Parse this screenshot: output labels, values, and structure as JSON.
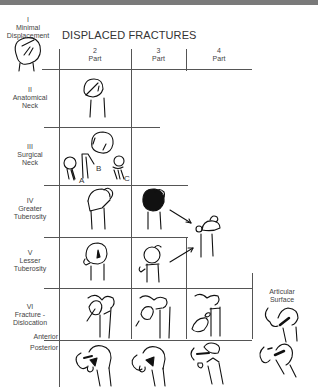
{
  "title": "DISPLACED FRACTURES",
  "columns": [
    {
      "num": "2",
      "label": "Part"
    },
    {
      "num": "3",
      "label": "Part"
    },
    {
      "num": "4",
      "label": "Part"
    }
  ],
  "rows": [
    {
      "roman": "I",
      "line1": "Minimal",
      "line2": "Displacement"
    },
    {
      "roman": "II",
      "line1": "Anatomical",
      "line2": "Neck"
    },
    {
      "roman": "III",
      "line1": "Surgical",
      "line2": "Neck"
    },
    {
      "roman": "IV",
      "line1": "Greater",
      "line2": "Tuberosity"
    },
    {
      "roman": "V",
      "line1": "Lesser",
      "line2": "Tuberosity"
    },
    {
      "roman": "VI",
      "line1": "Fracture -",
      "line2": "Dislocation"
    }
  ],
  "sublabels": {
    "anterior": "Anterior",
    "posterior": "Posterior"
  },
  "articular": {
    "line1": "Articular",
    "line2": "Surface"
  },
  "surgical_neck_parts": [
    "A",
    "B",
    "C"
  ],
  "colors": {
    "line": "#555555",
    "ink": "#111111",
    "topbar": "#7a7a7a"
  }
}
